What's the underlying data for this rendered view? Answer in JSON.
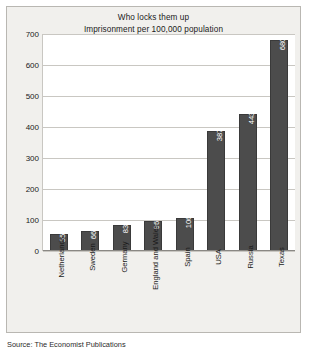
{
  "chart_data": {
    "type": "bar",
    "title": "Who locks them up",
    "subtitle": "Imprisonment per 100,000 population",
    "xlabel": "",
    "ylabel": "",
    "ylim": [
      0,
      700
    ],
    "ytick_step": 100,
    "yticks": [
      "700",
      "600",
      "500",
      "400",
      "300",
      "200",
      "100",
      "0"
    ],
    "grid": true,
    "legend": null,
    "bar_color": "#4c4c4c",
    "categories": [
      "Netherlands",
      "Sweden",
      "Germany",
      "England and Wales",
      "Spain",
      "USA",
      "Russia",
      "Texas"
    ],
    "values": [
      55,
      66,
      83,
      96,
      106,
      387,
      443,
      680
    ],
    "value_labels": [
      "55",
      "66",
      "83",
      "96",
      "106",
      "387",
      "443",
      "680"
    ]
  },
  "footer": {
    "source": "Source: The Economist Publications"
  }
}
